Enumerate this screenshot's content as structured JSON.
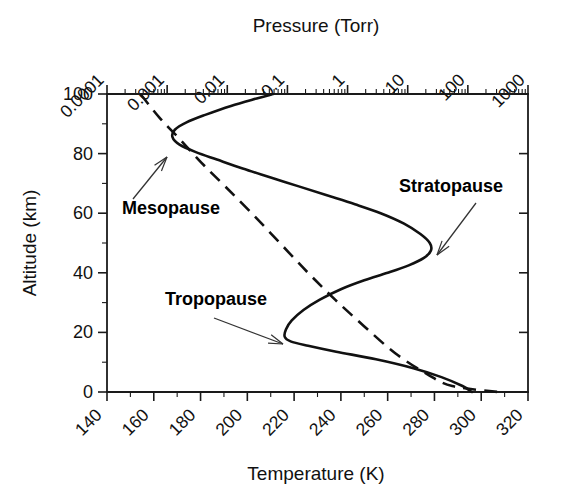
{
  "figure": {
    "title": "",
    "background": "#ffffff",
    "line_color": "#111111",
    "text_color": "#111111"
  },
  "chart_data": {
    "type": "line",
    "title": "",
    "xlabel": "Temperature (K)",
    "ylabel": "Altitude (km)",
    "top_axis_label": "Pressure (Torr)",
    "xlim": [
      140,
      320
    ],
    "ylim": [
      0,
      100
    ],
    "xticks": [
      140,
      160,
      180,
      200,
      220,
      240,
      260,
      280,
      300,
      320
    ],
    "xtick_labels": [
      "140",
      "160",
      "180",
      "200",
      "220",
      "240",
      "260",
      "280",
      "300",
      "320"
    ],
    "x_minor_step": 10,
    "yticks": [
      0,
      20,
      40,
      60,
      80,
      100
    ],
    "ytick_labels": [
      "0",
      "20",
      "40",
      "60",
      "80",
      "100"
    ],
    "y_minor_step": 10,
    "top_axis": {
      "label": "Pressure (Torr)",
      "scale": "log",
      "lim": [
        0.0001,
        1000
      ],
      "ticks": [
        0.0001,
        0.001,
        0.01,
        0.1,
        1,
        10,
        100,
        1000
      ],
      "tick_labels": [
        "0.0001",
        "0.001",
        "0.01",
        "0.1",
        "1",
        "10",
        "100",
        "1000"
      ],
      "minor_ticks_per_decade": [
        2,
        3,
        4,
        5,
        6,
        7,
        8,
        9
      ]
    },
    "grid": false,
    "legend": null,
    "series": [
      {
        "name": "Temperature profile",
        "style": "solid",
        "x_axis": "temperature",
        "points": [
          [
            296.0,
            0
          ],
          [
            292.0,
            2
          ],
          [
            283.0,
            5
          ],
          [
            271.0,
            8
          ],
          [
            255.0,
            11
          ],
          [
            238.0,
            13.5
          ],
          [
            226.0,
            15.5
          ],
          [
            218.5,
            17.0
          ],
          [
            216.0,
            18.5
          ],
          [
            216.5,
            21.0
          ],
          [
            219.0,
            24.0
          ],
          [
            224.0,
            27.5
          ],
          [
            231.0,
            31.0
          ],
          [
            240.0,
            34.5
          ],
          [
            250.0,
            37.5
          ],
          [
            260.0,
            40.0
          ],
          [
            269.0,
            42.5
          ],
          [
            275.5,
            45.0
          ],
          [
            278.5,
            47.5
          ],
          [
            278.0,
            50.0
          ],
          [
            274.0,
            53.0
          ],
          [
            267.0,
            56.5
          ],
          [
            257.0,
            60.0
          ],
          [
            246.0,
            63.0
          ],
          [
            234.0,
            66.0
          ],
          [
            222.0,
            69.0
          ],
          [
            210.0,
            72.0
          ],
          [
            198.0,
            75.0
          ],
          [
            187.0,
            78.0
          ],
          [
            178.0,
            80.5
          ],
          [
            171.0,
            83.0
          ],
          [
            168.0,
            85.5
          ],
          [
            169.0,
            88.0
          ],
          [
            174.0,
            90.5
          ],
          [
            182.0,
            93.0
          ],
          [
            193.0,
            96.0
          ],
          [
            204.0,
            98.5
          ],
          [
            211.0,
            100.0
          ]
        ]
      },
      {
        "name": "Pressure profile",
        "style": "dashed",
        "x_axis": "pressure",
        "points": [
          [
            0.00036,
            100
          ],
          [
            0.00075,
            92
          ],
          [
            0.0016,
            85
          ],
          [
            0.0037,
            77
          ],
          [
            0.0092,
            69
          ],
          [
            0.0255,
            60
          ],
          [
            0.075,
            50
          ],
          [
            0.22,
            40
          ],
          [
            0.62,
            31
          ],
          [
            1.9,
            22
          ],
          [
            6.2,
            13
          ],
          [
            21.0,
            6
          ],
          [
            55.0,
            2
          ],
          [
            320.0,
            0
          ]
        ],
        "note": "dashed line drawn as straight segment from top-left to bottom-right of plot frame"
      }
    ],
    "annotations": [
      {
        "text": "Mesopause",
        "label_x": 122,
        "label_y": 214,
        "arrow_from": [
          133,
          199
        ],
        "arrow_to": [
          167,
          157
        ],
        "points_to": "temperature minimum near 85 km"
      },
      {
        "text": "Stratopause",
        "label_x": 399,
        "label_y": 192,
        "arrow_from": [
          476,
          203
        ],
        "arrow_to": [
          437,
          255
        ],
        "points_to": "temperature maximum near 47 km"
      },
      {
        "text": "Tropopause",
        "label_x": 165,
        "label_y": 305,
        "arrow_from": [
          214,
          318
        ],
        "arrow_to": [
          283,
          344
        ],
        "points_to": "temperature minimum near 17 km"
      }
    ]
  }
}
